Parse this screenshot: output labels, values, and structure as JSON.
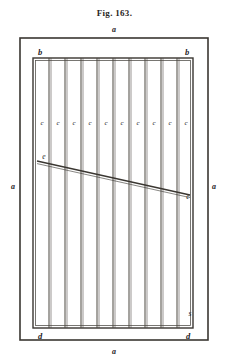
{
  "figure": {
    "caption": "Fig. 163.",
    "canvas": {
      "width": 229,
      "height": 364
    },
    "ink_color": "#26231f",
    "paper_color": "#ffffff"
  },
  "outer_frame": {
    "name": "outer-wall-rectangle",
    "x": 20,
    "y": 18,
    "width": 188,
    "height": 302,
    "stroke": "#3a3631",
    "stroke_width": 1.6
  },
  "inner_frame": {
    "name": "grate-frame",
    "x": 33,
    "y": 38,
    "width": 160,
    "height": 270,
    "stroke": "#3a3631",
    "stroke_width": 1.4
  },
  "bars": {
    "count": 9,
    "orientation": "vertical",
    "double_line": true,
    "x_positions": [
      49,
      65,
      81,
      97,
      113,
      129,
      145,
      161,
      177
    ],
    "top": 38,
    "bottom": 308,
    "stroke": "#4a463f",
    "stroke_width": 1.0
  },
  "diagonal": {
    "name": "sloping-water-line",
    "x1": 37,
    "y1": 141,
    "x2": 190,
    "y2": 175,
    "stroke": "#3a3631",
    "stroke_width": 1.3,
    "double_line": true
  },
  "labels": [
    {
      "id": "a-top",
      "text": "a",
      "x": 114,
      "y": 10,
      "kind": "a"
    },
    {
      "id": "a-left",
      "text": "a",
      "x": 13,
      "y": 167,
      "kind": "a"
    },
    {
      "id": "a-right",
      "text": "a",
      "x": 214,
      "y": 167,
      "kind": "a"
    },
    {
      "id": "a-bottom",
      "text": "a",
      "x": 114,
      "y": 332,
      "kind": "a"
    },
    {
      "id": "b-left",
      "text": "b",
      "x": 40,
      "y": 32,
      "kind": "b"
    },
    {
      "id": "b-right",
      "text": "b",
      "x": 187,
      "y": 32,
      "kind": "b"
    },
    {
      "id": "d-left",
      "text": "d",
      "x": 40,
      "y": 316,
      "kind": "d"
    },
    {
      "id": "d-right",
      "text": "d",
      "x": 188,
      "y": 316,
      "kind": "d"
    },
    {
      "id": "c-1",
      "text": "c",
      "x": 42,
      "y": 103,
      "kind": "c"
    },
    {
      "id": "c-2",
      "text": "c",
      "x": 58,
      "y": 103,
      "kind": "c"
    },
    {
      "id": "c-3",
      "text": "c",
      "x": 74,
      "y": 103,
      "kind": "c"
    },
    {
      "id": "c-4",
      "text": "c",
      "x": 90,
      "y": 103,
      "kind": "c"
    },
    {
      "id": "c-5",
      "text": "c",
      "x": 106,
      "y": 103,
      "kind": "c"
    },
    {
      "id": "c-6",
      "text": "c",
      "x": 122,
      "y": 103,
      "kind": "c"
    },
    {
      "id": "c-7",
      "text": "c",
      "x": 138,
      "y": 103,
      "kind": "c"
    },
    {
      "id": "c-8",
      "text": "c",
      "x": 154,
      "y": 103,
      "kind": "c"
    },
    {
      "id": "c-9",
      "text": "c",
      "x": 170,
      "y": 103,
      "kind": "c"
    },
    {
      "id": "c-10",
      "text": "c",
      "x": 186,
      "y": 103,
      "kind": "c"
    },
    {
      "id": "e-left",
      "text": "e",
      "x": 44,
      "y": 137,
      "kind": "e"
    },
    {
      "id": "e-right",
      "text": "e",
      "x": 188,
      "y": 177,
      "kind": "e"
    },
    {
      "id": "s-mark",
      "text": "s",
      "x": 190,
      "y": 294,
      "kind": "s"
    }
  ]
}
